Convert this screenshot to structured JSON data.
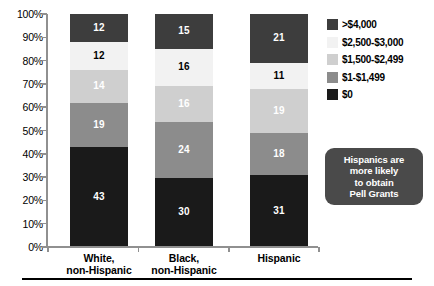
{
  "chart_data": {
    "type": "bar",
    "subtype": "100% stacked column",
    "title": "",
    "subtitle": "",
    "xlabel": "",
    "ylabel": "",
    "categories": [
      "White, non-Hispanic",
      "Black, non-Hispanic",
      "Hispanic"
    ],
    "category_lines": [
      [
        "White,",
        "non-Hispanic"
      ],
      [
        "Black,",
        "non-Hispanic"
      ],
      [
        "Hispanic"
      ]
    ],
    "series": [
      {
        "name": "$0",
        "color": "#1a1a1a",
        "label_color": "#ffffff",
        "values": [
          43,
          30,
          31
        ]
      },
      {
        "name": "$1-$1,499",
        "color": "#8c8c8c",
        "label_color": "#ffffff",
        "values": [
          19,
          24,
          18
        ]
      },
      {
        "name": "$1,500-$2,499",
        "color": "#cfcfcf",
        "label_color": "#ffffff",
        "values": [
          14,
          16,
          19
        ]
      },
      {
        "name": "$2,500-$3,000",
        "color": "#f2f2f2",
        "label_color": "#000000",
        "values": [
          12,
          16,
          11
        ]
      },
      {
        "name": ">$4,000",
        "color": "#3d3d3d",
        "label_color": "#ffffff",
        "values": [
          12,
          15,
          21
        ]
      }
    ],
    "stack_order_bottom_to_top": [
      "$0",
      "$1-$1,499",
      "$1,500-$2,499",
      "$2,500-$3,000",
      ">$4,000"
    ],
    "ylim": [
      0,
      100
    ],
    "ytick_step": 10,
    "ytick_labels": [
      "100%",
      "90%",
      "80%",
      "70%",
      "60%",
      "50%",
      "40%",
      "30%",
      "20%",
      "10%",
      "0%"
    ],
    "grid": false,
    "legend_position": "right-top",
    "legend_order_top_to_bottom": [
      ">$4,000",
      "$2,500-$3,000",
      "$1,500-$2,499",
      "$1-$1,499",
      "$0"
    ],
    "axis_color": "#909090"
  },
  "legend": {
    "items": [
      {
        "label": ">$4,000",
        "color": "#3d3d3d"
      },
      {
        "label": "$2,500-$3,000",
        "color": "#f2f2f2"
      },
      {
        "label": "$1,500-$2,499",
        "color": "#cfcfcf"
      },
      {
        "label": "$1-$1,499",
        "color": "#8c8c8c"
      },
      {
        "label": "$0",
        "color": "#1a1a1a"
      }
    ]
  },
  "callout": {
    "background": "#4a4a4a",
    "text_color": "#ffffff",
    "lines": [
      "Hispanics are",
      "more likely",
      "to obtain",
      "Pell Grants"
    ],
    "full_text": "Hispanics are more likely to obtain Pell Grants"
  }
}
